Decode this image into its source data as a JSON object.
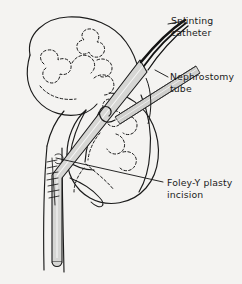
{
  "figure": {
    "type": "medical-line-illustration",
    "background_color": "#f4f3f1",
    "ink_color": "#1b1b1b",
    "tube_fill_color": "#d6d6d4",
    "catheter_color": "#141414"
  },
  "labels": {
    "splinting_catheter": {
      "line1": "Splinting",
      "line2": "catheter"
    },
    "nephrostomy_tube": {
      "line1": "Nephrostomy",
      "line2": "tube"
    },
    "foley_y_plasty": {
      "line1": "Foley-Y plasty",
      "line2": "incision"
    }
  },
  "anatomy": {
    "organ": "kidney",
    "structures": [
      "renal cortex outline",
      "calyceal system (dashed)",
      "renal pelvis",
      "ureter",
      "suture line"
    ]
  }
}
